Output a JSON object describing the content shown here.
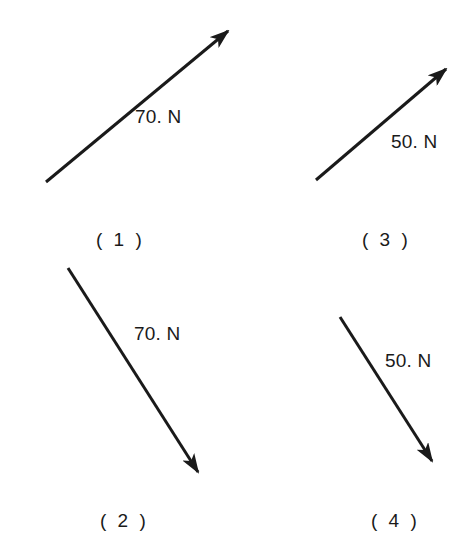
{
  "figure": {
    "vectors": [
      {
        "id": 1,
        "magnitude_label": "70. N",
        "caption": "( 1 )",
        "direction": "up-right",
        "start": [
          46,
          182
        ],
        "end": [
          228,
          31
        ],
        "label_pos": [
          135,
          106
        ],
        "caption_pos": [
          96,
          228
        ]
      },
      {
        "id": 2,
        "magnitude_label": "70. N",
        "caption": "( 2 )",
        "direction": "down-right",
        "start": [
          68,
          268
        ],
        "end": [
          198,
          472
        ],
        "label_pos": [
          134,
          325
        ],
        "caption_pos": [
          100,
          509
        ]
      },
      {
        "id": 3,
        "magnitude_label": "50. N",
        "caption": "( 3 )",
        "direction": "up-right",
        "start": [
          316,
          180
        ],
        "end": [
          446,
          69
        ],
        "label_pos": [
          392,
          137
        ],
        "caption_pos": [
          361,
          228
        ]
      },
      {
        "id": 4,
        "magnitude_label": "50. N",
        "caption": "( 4 )",
        "direction": "down-right",
        "start": [
          340,
          317
        ],
        "end": [
          432,
          461
        ],
        "label_pos": [
          385,
          350
        ],
        "caption_pos": [
          371,
          509
        ]
      }
    ],
    "colors": {
      "stroke": "#1a1a1a",
      "background": "#ffffff"
    }
  }
}
